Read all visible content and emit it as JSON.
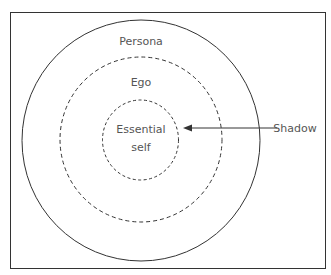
{
  "diagram": {
    "labels": {
      "persona": "Persona",
      "ego": "Ego",
      "essential_line1": "Essential",
      "essential_line2": "self",
      "shadow": "Shadow"
    },
    "colors": {
      "stroke": "#333333",
      "text": "#555555",
      "background": "#ffffff"
    }
  }
}
